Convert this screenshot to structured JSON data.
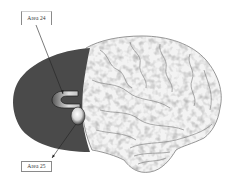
{
  "figure": {
    "labels": {
      "area24": "Area 24",
      "area25": "Area 25"
    },
    "colors": {
      "medial_region": "#4a4a4a",
      "background": "#ffffff",
      "brain_gyri": "#f2f2f2",
      "brain_sulci": "#6e6e6e",
      "leader_line": "#222222"
    }
  }
}
